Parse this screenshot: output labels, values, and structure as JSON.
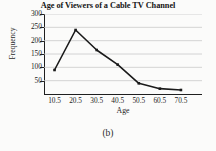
{
  "figure": {
    "caption": "(b)"
  },
  "chart_data": {
    "type": "line",
    "title": "Age of Viewers of a Cable TV Channel",
    "xlabel": "Age",
    "ylabel": "Frequency",
    "categories": [
      "10.5",
      "20.5",
      "30.5",
      "40.5",
      "50.5",
      "60.5",
      "70.5"
    ],
    "x": [
      10.5,
      20.5,
      30.5,
      40.5,
      50.5,
      60.5,
      70.5
    ],
    "values": [
      90,
      240,
      165,
      110,
      40,
      20,
      15
    ],
    "xtick_labels": [
      "10.5",
      "20.5",
      "30.5",
      "40.5",
      "50.5",
      "60.5",
      "70.5"
    ],
    "ytick_labels": [
      "50",
      "100",
      "150",
      "200",
      "250",
      "300"
    ],
    "yticks": [
      50,
      100,
      150,
      200,
      250,
      300
    ],
    "ylim": [
      0,
      300
    ],
    "xlim": [
      5.5,
      80.5
    ],
    "grid": "horizontal",
    "legend": "none",
    "marker": "filled-square",
    "line_color": "#1a1a1a",
    "grid_color": "#c9c9c9",
    "axis_color": "#1f1f1f"
  }
}
